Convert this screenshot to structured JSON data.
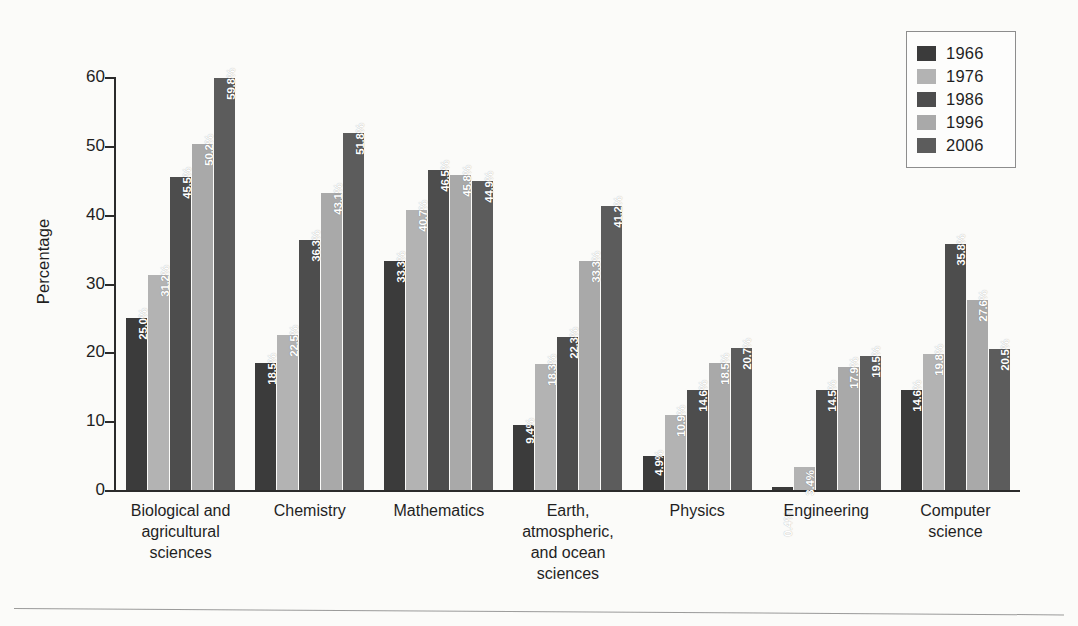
{
  "chart_data": {
    "type": "bar",
    "title": "",
    "xlabel": "",
    "ylabel": "Percentage",
    "ylim": [
      0,
      60
    ],
    "yticks": [
      0,
      10,
      20,
      30,
      40,
      50,
      60
    ],
    "ytick_labels": [
      "0",
      "10",
      "20",
      "30",
      "40",
      "50",
      "60"
    ],
    "grid": false,
    "legend_position": "top-right",
    "value_label_suffix": "%",
    "categories": [
      "Biological and agricultural sciences",
      "Chemistry",
      "Mathematics",
      "Earth, atmospheric, and ocean sciences",
      "Physics",
      "Engineering",
      "Computer science"
    ],
    "category_lines": [
      [
        "Biological and",
        "agricultural",
        "sciences"
      ],
      [
        "Chemistry"
      ],
      [
        "Mathematics"
      ],
      [
        "Earth,",
        "atmospheric,",
        "and ocean",
        "sciences"
      ],
      [
        "Physics"
      ],
      [
        "Engineering"
      ],
      [
        "Computer",
        "science"
      ]
    ],
    "series": [
      {
        "name": "1966",
        "color": "#3b3b3b",
        "values": [
          25.0,
          18.5,
          33.3,
          9.4,
          4.9,
          0.4,
          14.6
        ],
        "labels": [
          "25.0%",
          "18.5%",
          "33.3%",
          "9.4%",
          "4.9%",
          "0.4%",
          "14.6%"
        ]
      },
      {
        "name": "1976",
        "color": "#b3b3b3",
        "values": [
          31.2,
          22.5,
          40.7,
          18.3,
          10.9,
          3.4,
          19.8
        ],
        "labels": [
          "31.2%",
          "22.5%",
          "40.7%",
          "18.3%",
          "10.9%",
          "3.4%",
          "19.8%"
        ]
      },
      {
        "name": "1986",
        "color": "#4d4d4d",
        "values": [
          45.5,
          36.3,
          46.5,
          22.3,
          14.6,
          14.5,
          35.8
        ],
        "labels": [
          "45.5%",
          "36.3%",
          "46.5%",
          "22.3%",
          "14.6%",
          "14.5%",
          "35.8%"
        ]
      },
      {
        "name": "1996",
        "color": "#a9a9a9",
        "values": [
          50.2,
          43.1,
          45.8,
          33.3,
          18.5,
          17.9,
          27.6
        ],
        "labels": [
          "50.2%",
          "43.1%",
          "45.8%",
          "33.3%",
          "18.5%",
          "17.9%",
          "27.6%"
        ]
      },
      {
        "name": "2006",
        "color": "#5c5c5c",
        "values": [
          59.8,
          51.8,
          44.9,
          41.2,
          20.7,
          19.5,
          20.5
        ],
        "labels": [
          "59.8%",
          "51.8%",
          "44.9%",
          "41.2%",
          "20.7%",
          "19.5%",
          "20.5%"
        ]
      }
    ]
  }
}
